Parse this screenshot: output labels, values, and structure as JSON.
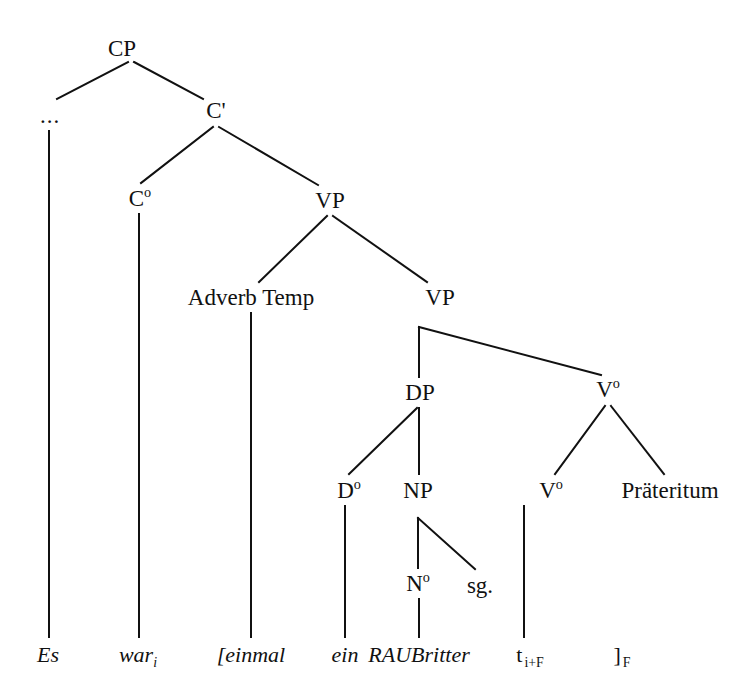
{
  "figure": {
    "width": 755,
    "height": 699,
    "background": "#ffffff",
    "stroke_color": "#111111",
    "stroke_width": 2,
    "text_color": "#111111"
  },
  "chart_data": {
    "type": "diagram",
    "subtype": "syntax-tree",
    "title": "",
    "sentence": "Es warᵢ [einmal ein RAUBritter tᵢ₊ᶠ ]ᶠ",
    "language": "German",
    "nodes": [
      {
        "id": "CP",
        "label": "CP",
        "x": 122,
        "y": 48,
        "kind": "category"
      },
      {
        "id": "ELLIPSIS",
        "label": "...",
        "x": 50,
        "y": 115,
        "kind": "category"
      },
      {
        "id": "CBAR",
        "label": "C'",
        "x": 216,
        "y": 110,
        "kind": "category"
      },
      {
        "id": "C0",
        "label": "C",
        "sup": "o",
        "x": 140,
        "y": 198,
        "kind": "category"
      },
      {
        "id": "VP1",
        "label": "VP",
        "x": 330,
        "y": 200,
        "kind": "category"
      },
      {
        "id": "ADVTEMP",
        "label": "Adverb Temp",
        "x": 251,
        "y": 297,
        "kind": "category"
      },
      {
        "id": "VP2",
        "label": "VP",
        "x": 440,
        "y": 297,
        "kind": "category"
      },
      {
        "id": "DP",
        "label": "DP",
        "x": 420,
        "y": 392,
        "kind": "category"
      },
      {
        "id": "V0UP",
        "label": "V",
        "sup": "o",
        "x": 608,
        "y": 389,
        "kind": "category"
      },
      {
        "id": "D0",
        "label": "D",
        "sup": "o",
        "x": 349,
        "y": 490,
        "kind": "category"
      },
      {
        "id": "NP",
        "label": "NP",
        "x": 418,
        "y": 490,
        "kind": "category"
      },
      {
        "id": "V0LOW",
        "label": "V",
        "sup": "o",
        "x": 551,
        "y": 490,
        "kind": "category"
      },
      {
        "id": "PRAETERITUM",
        "label": "Präteritum",
        "x": 670,
        "y": 490,
        "kind": "category"
      },
      {
        "id": "N0",
        "label": "N",
        "sup": "o",
        "x": 418,
        "y": 583,
        "kind": "category"
      },
      {
        "id": "SG",
        "label": "sg.",
        "x": 480,
        "y": 585,
        "kind": "category"
      }
    ],
    "terminals": [
      {
        "id": "T_ES",
        "label": "Es",
        "x": 48,
        "y": 655,
        "style": "italic"
      },
      {
        "id": "T_WAR",
        "label": "war",
        "sub": "i",
        "x": 138,
        "y": 655,
        "style": "italic"
      },
      {
        "id": "T_EINMAL",
        "label": "[einmal",
        "x": 251,
        "y": 655,
        "style": "italic"
      },
      {
        "id": "T_EIN",
        "label": "ein",
        "x": 345,
        "y": 655,
        "style": "italic"
      },
      {
        "id": "T_RAUBRITTER",
        "label": "RAUBritter",
        "x": 419,
        "y": 655,
        "style": "italic"
      },
      {
        "id": "T_TRACE",
        "label": "t",
        "sub_upright": "i+F",
        "x": 530,
        "y": 655,
        "style": "upright"
      },
      {
        "id": "T_BRACKET",
        "label": "]",
        "sub_upright": "F",
        "x": 622,
        "y": 655,
        "style": "upright"
      }
    ],
    "edges": [
      {
        "from": "CP",
        "to": "ELLIPSIS",
        "x1": 128,
        "y1": 62,
        "x2": 57,
        "y2": 99
      },
      {
        "from": "CP",
        "to": "CBAR",
        "x1": 134,
        "y1": 62,
        "x2": 203,
        "y2": 99
      },
      {
        "from": "ELLIPSIS",
        "to": "T_ES",
        "x1": 49,
        "y1": 131,
        "x2": 49,
        "y2": 637
      },
      {
        "from": "CBAR",
        "to": "C0",
        "x1": 213,
        "y1": 127,
        "x2": 141,
        "y2": 183
      },
      {
        "from": "CBAR",
        "to": "VP1",
        "x1": 219,
        "y1": 127,
        "x2": 318,
        "y2": 185
      },
      {
        "from": "C0",
        "to": "T_WAR",
        "x1": 139,
        "y1": 214,
        "x2": 139,
        "y2": 637
      },
      {
        "from": "VP1",
        "to": "ADVTEMP",
        "x1": 327,
        "y1": 216,
        "x2": 259,
        "y2": 282
      },
      {
        "from": "VP1",
        "to": "VP2",
        "x1": 333,
        "y1": 216,
        "x2": 427,
        "y2": 282
      },
      {
        "from": "ADVTEMP",
        "to": "T_EINMAL",
        "x1": 251,
        "y1": 313,
        "x2": 251,
        "y2": 637
      },
      {
        "from": "VP2",
        "to": "DP",
        "x1": 419,
        "y1": 327,
        "x2": 419,
        "y2": 377
      },
      {
        "from": "VP2",
        "to": "V0UP",
        "x1": 419,
        "y1": 327,
        "x2": 601,
        "y2": 375
      },
      {
        "from": "DP",
        "to": "D0",
        "x1": 417,
        "y1": 408,
        "x2": 349,
        "y2": 474
      },
      {
        "from": "DP",
        "to": "NP",
        "x1": 419,
        "y1": 408,
        "x2": 419,
        "y2": 474
      },
      {
        "from": "D0",
        "to": "T_EIN",
        "x1": 345,
        "y1": 506,
        "x2": 345,
        "y2": 637
      },
      {
        "from": "NP",
        "to": "N0",
        "x1": 418,
        "y1": 518,
        "x2": 418,
        "y2": 568
      },
      {
        "from": "NP",
        "to": "SG",
        "x1": 418,
        "y1": 518,
        "x2": 475,
        "y2": 569
      },
      {
        "from": "N0",
        "to": "T_RAUBRITTER",
        "x1": 419,
        "y1": 599,
        "x2": 419,
        "y2": 637
      },
      {
        "from": "V0UP",
        "to": "V0LOW",
        "x1": 605,
        "y1": 406,
        "x2": 555,
        "y2": 474
      },
      {
        "from": "V0UP",
        "to": "PRAETERITUM",
        "x1": 611,
        "y1": 406,
        "x2": 664,
        "y2": 474
      },
      {
        "from": "V0LOW",
        "to": "T_TRACE",
        "x1": 524,
        "y1": 506,
        "x2": 524,
        "y2": 637
      }
    ]
  }
}
